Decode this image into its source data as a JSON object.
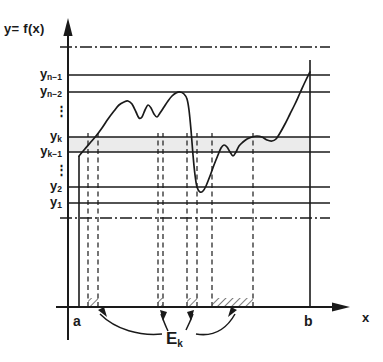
{
  "figure": {
    "axis_y_label": "y= f(x)",
    "axis_x_label": "x",
    "left_endpoint_label": "a",
    "right_endpoint_label": "b",
    "set_label": "E",
    "set_label_subscript": "k",
    "vdots_upper": "⋮",
    "vdots_lower": "⋮",
    "ink_color": "#1a1a1a",
    "band_fill": "#ebebeb"
  },
  "y_ticks": [
    {
      "name": "y",
      "sub": "n−1",
      "y": 75
    },
    {
      "name": "y",
      "sub": "n−2",
      "y": 92
    },
    {
      "name": "y",
      "sub": "k",
      "y": 137
    },
    {
      "name": "y",
      "sub": "k−1",
      "y": 152
    },
    {
      "name": "y",
      "sub": "2",
      "y": 187
    },
    {
      "name": "y",
      "sub": "1",
      "y": 203
    }
  ],
  "chart_data": {
    "type": "line",
    "title": "",
    "xlabel": "x",
    "ylabel": "y= f(x)",
    "grid": true,
    "legend": "none",
    "domain_labels": [
      "a",
      "b"
    ],
    "level_lines": [
      75,
      92,
      137,
      152,
      187,
      203
    ],
    "dashdot_line_top": 47,
    "dashdot_line_low": 218,
    "band": {
      "from_label": "y_{k-1}",
      "to_label": "y_k",
      "y_top": 137,
      "y_bottom": 152
    },
    "x_axis_y": 307,
    "x_left": 79,
    "x_right": 310,
    "preimage_intervals": [
      {
        "x0": 88,
        "x1": 98
      },
      {
        "x0": 158,
        "x1": 163
      },
      {
        "x0": 187,
        "x1": 197
      },
      {
        "x0": 212,
        "x1": 253
      }
    ],
    "drop_lines": [
      88,
      98,
      158,
      163,
      187,
      197,
      212,
      253
    ],
    "curve_points": [
      [
        79,
        156
      ],
      [
        84,
        150
      ],
      [
        90,
        143
      ],
      [
        96,
        136
      ],
      [
        102,
        128
      ],
      [
        108,
        119
      ],
      [
        114,
        111
      ],
      [
        119,
        105
      ],
      [
        124,
        102
      ],
      [
        128,
        101
      ],
      [
        132,
        104
      ],
      [
        136,
        112
      ],
      [
        139,
        118
      ],
      [
        142,
        117
      ],
      [
        145,
        110
      ],
      [
        148,
        105
      ],
      [
        151,
        108
      ],
      [
        154,
        114
      ],
      [
        157,
        117
      ],
      [
        160,
        113
      ],
      [
        164,
        107
      ],
      [
        168,
        101
      ],
      [
        172,
        96
      ],
      [
        176,
        93
      ],
      [
        180,
        92
      ],
      [
        184,
        94
      ],
      [
        187,
        99
      ],
      [
        189,
        110
      ],
      [
        191,
        130
      ],
      [
        193,
        155
      ],
      [
        195,
        175
      ],
      [
        197,
        187
      ],
      [
        200,
        192
      ],
      [
        203,
        191
      ],
      [
        206,
        186
      ],
      [
        210,
        176
      ],
      [
        214,
        165
      ],
      [
        218,
        155
      ],
      [
        221,
        148
      ],
      [
        224,
        145
      ],
      [
        227,
        147
      ],
      [
        230,
        152
      ],
      [
        233,
        156
      ],
      [
        236,
        152
      ],
      [
        239,
        146
      ],
      [
        243,
        142
      ],
      [
        247,
        139
      ],
      [
        252,
        137
      ],
      [
        257,
        136
      ],
      [
        262,
        137
      ],
      [
        267,
        140
      ],
      [
        272,
        141
      ],
      [
        276,
        139
      ],
      [
        280,
        133
      ],
      [
        285,
        124
      ],
      [
        290,
        114
      ],
      [
        295,
        104
      ],
      [
        300,
        93
      ],
      [
        305,
        82
      ],
      [
        310,
        72
      ]
    ]
  }
}
